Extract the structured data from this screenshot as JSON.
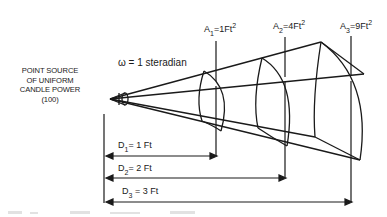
{
  "diagram": {
    "source_label": [
      "POINT SOURCE",
      "OF UNIFORM",
      "CANDLE POWER",
      "(100)"
    ],
    "solid_angle": {
      "symbol": "ω",
      "text": "= 1 steradian"
    },
    "areas": [
      {
        "name": "A",
        "sub": "1",
        "eq": "=1Ft",
        "sup": "2"
      },
      {
        "name": "A",
        "sub": "2",
        "eq": "=4Ft",
        "sup": "2"
      },
      {
        "name": "A",
        "sub": "3",
        "eq": "=9Ft",
        "sup": "2"
      }
    ],
    "distances": [
      {
        "name": "D",
        "sub": "1",
        "eq": "=  1 Ft"
      },
      {
        "name": "D",
        "sub": "2",
        "eq": "=  2 Ft"
      },
      {
        "name": "D",
        "sub": "3",
        "eq": " = 3 Ft"
      }
    ],
    "colors": {
      "line": "#1a1a1a",
      "background": "#ffffff",
      "artifact": "#d8d8d8"
    }
  }
}
